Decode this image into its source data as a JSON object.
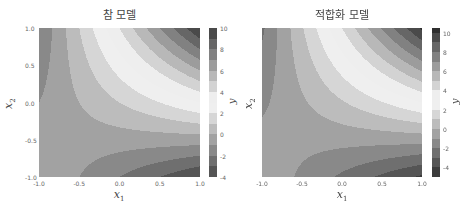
{
  "chart_data": [
    {
      "type": "heatmap",
      "subtype": "filled-contour",
      "title": "참 모델",
      "xlabel": "x1",
      "ylabel": "x2",
      "colorbar_label": "y",
      "function": "y = 1 + 2*x1 + 3*x2 + 4*x1*x2",
      "coefficients": {
        "c0": 1,
        "c1": 2,
        "c2": 3,
        "c12": 4
      },
      "xlim": [
        -1.0,
        1.0
      ],
      "ylim": [
        -1.0,
        1.0
      ],
      "xticks": [
        "-1.0",
        "-0.5",
        "0.0",
        "0.5",
        "1.0"
      ],
      "yticks": [
        "-1.0",
        "-0.5",
        "0.0",
        "0.5",
        "1.0"
      ],
      "colorbar_range": [
        -4,
        10
      ],
      "colorbar_ticks": [
        "10",
        "8",
        "6",
        "4",
        "2",
        "0",
        "-2",
        "-4"
      ],
      "levels_step": 1,
      "colormap": "diverging gray (dark at extremes, white near 3)",
      "grid": false,
      "corner_values": {
        "(-1,-1)": 0,
        "(1,-1)": -4,
        "(-1,1)": -2,
        "(1,1)": 10
      }
    },
    {
      "type": "heatmap",
      "subtype": "filled-contour",
      "title": "적합화 모델",
      "xlabel": "x1",
      "ylabel": "x2",
      "colorbar_label": "y",
      "function": "fitted approx. of y = 1 + 2*x1 + 3*x2 + 4*x1*x2",
      "coefficients": {
        "c0": 0.9,
        "c1": 2.1,
        "c2": 3.1,
        "c12": 4.1
      },
      "xlim": [
        -1.0,
        1.0
      ],
      "ylim": [
        -1.0,
        1.0
      ],
      "xticks": [
        "-1.0",
        "-0.5",
        "0.0",
        "0.5",
        "1.0"
      ],
      "yticks": [],
      "colorbar_range": [
        -5,
        10.5
      ],
      "colorbar_ticks": [
        "10",
        "8",
        "6",
        "4",
        "2",
        "0",
        "-2",
        "-4"
      ],
      "levels_step": 1,
      "colormap": "diverging gray (dark at extremes, white near 3)",
      "grid": false
    }
  ],
  "panels": [
    {
      "title": "참 모델",
      "xlabel": "x",
      "xlabel_sub": "1",
      "ylabel": "x",
      "ylabel_sub": "2",
      "cb_label": "y",
      "xticks": [
        {
          "label": "-1.0",
          "v": -1.0
        },
        {
          "label": "-0.5",
          "v": -0.5
        },
        {
          "label": "0.0",
          "v": 0.0
        },
        {
          "label": "0.5",
          "v": 0.5
        },
        {
          "label": "1.0",
          "v": 1.0
        }
      ],
      "yticks": [
        {
          "label": "1.0",
          "v": 1.0
        },
        {
          "label": "0.5",
          "v": 0.5
        },
        {
          "label": "0.0",
          "v": 0.0
        },
        {
          "label": "-0.5",
          "v": -0.5
        },
        {
          "label": "-1.0",
          "v": -1.0
        }
      ],
      "cbticks": [
        {
          "label": "10",
          "v": 10
        },
        {
          "label": "8",
          "v": 8
        },
        {
          "label": "6",
          "v": 6
        },
        {
          "label": "4",
          "v": 4
        },
        {
          "label": "2",
          "v": 2
        },
        {
          "label": "0",
          "v": 0
        },
        {
          "label": "-2",
          "v": -2
        },
        {
          "label": "-4",
          "v": -4
        }
      ]
    },
    {
      "title": "적합화 모델",
      "xlabel": "x",
      "xlabel_sub": "1",
      "ylabel": "x",
      "ylabel_sub": "2",
      "cb_label": "y",
      "xticks": [
        {
          "label": "-1.0",
          "v": -1.0
        },
        {
          "label": "-0.5",
          "v": -0.5
        },
        {
          "label": "0.0",
          "v": 0.0
        },
        {
          "label": "0.5",
          "v": 0.5
        },
        {
          "label": "1.0",
          "v": 1.0
        }
      ],
      "yticks": [],
      "cbticks": [
        {
          "label": "10",
          "v": 10
        },
        {
          "label": "8",
          "v": 8
        },
        {
          "label": "6",
          "v": 6
        },
        {
          "label": "4",
          "v": 4
        },
        {
          "label": "2",
          "v": 2
        },
        {
          "label": "0",
          "v": 0
        },
        {
          "label": "-2",
          "v": -2
        },
        {
          "label": "-4",
          "v": -4
        }
      ]
    }
  ]
}
